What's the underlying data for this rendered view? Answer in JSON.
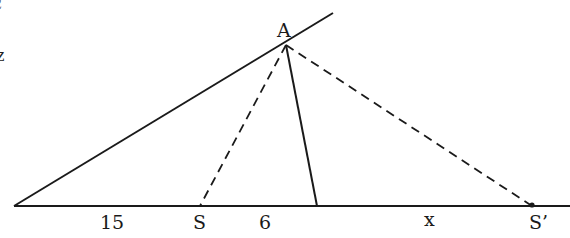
{
  "diagram": {
    "type": "geometry-triangle",
    "points": {
      "A": {
        "label": "A",
        "x": 286,
        "y": 45
      },
      "S": {
        "label": "S",
        "x": 200,
        "y": 206
      },
      "S_prime": {
        "label": "S’",
        "x": 532,
        "y": 206
      }
    },
    "segment_labels": {
      "left_segment": "15",
      "middle_segment": "6",
      "right_segment": "x"
    },
    "edge_marks": {
      "top": "ℓ",
      "middle": "z"
    },
    "colors": {
      "line": "#1a1a1a",
      "background": "#ffffff"
    }
  }
}
